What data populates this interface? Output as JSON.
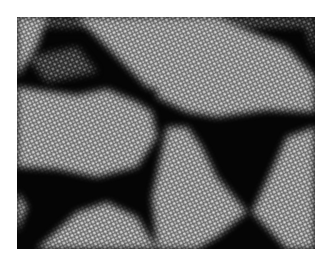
{
  "image": {
    "description": "Grayscale microscopy-style texture: bright hexagonal-dot lattice regions forming bow-tie and triangular domains on a dark background",
    "colors": {
      "background": "#ffffff",
      "dark": "#050505",
      "light": "#9a9a9a",
      "dot": "#e6e6e6"
    }
  }
}
